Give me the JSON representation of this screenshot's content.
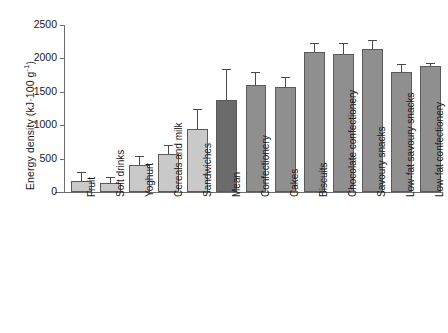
{
  "chart_data": {
    "type": "bar",
    "title": "",
    "xlabel": "",
    "ylabel": "Energy density (kJ·100 g",
    "ylabel_sup": "-1",
    "ylabel_tail": ")",
    "ylim": [
      0,
      2500
    ],
    "yticks": [
      0,
      500,
      1000,
      1500,
      2000,
      2500
    ],
    "ytick_labels": [
      "0",
      "500",
      "1000",
      "1500",
      "2000",
      "2500"
    ],
    "grid": false,
    "legend": "none",
    "categories": [
      "Fruit",
      "Soft drinks",
      "Yoghurt",
      "Cereals and milk",
      "Sandwiches",
      "Mean",
      "Confectionery",
      "Cakes",
      "Biscuits",
      "Chocolate confectionery",
      "Savoury snacks",
      "Low-fat savoury snacks",
      "Low-fat confectionery"
    ],
    "values": [
      170,
      135,
      410,
      575,
      940,
      1370,
      1600,
      1575,
      2100,
      2070,
      2140,
      1790,
      1890
    ],
    "errors": [
      110,
      70,
      120,
      110,
      290,
      450,
      180,
      130,
      110,
      140,
      120,
      110,
      30
    ],
    "bar_colors": [
      "#c9c9c9",
      "#c9c9c9",
      "#c9c9c9",
      "#c9c9c9",
      "#c9c9c9",
      "#6b6b6b",
      "#8f8f8f",
      "#8f8f8f",
      "#8f8f8f",
      "#8f8f8f",
      "#8f8f8f",
      "#8f8f8f",
      "#8f8f8f"
    ],
    "axis_color": "#6d6d6d",
    "error_bar_color": "#4a4a4a",
    "background": "#ffffff"
  }
}
